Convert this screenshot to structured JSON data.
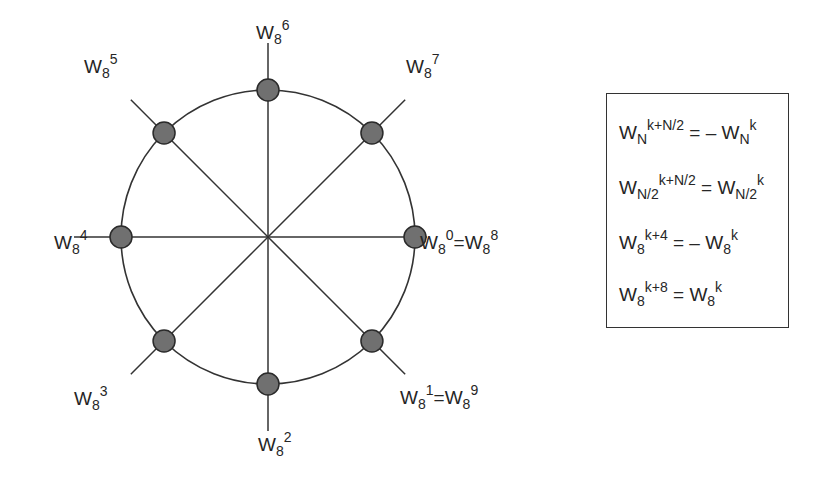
{
  "diagram": {
    "colors": {
      "node_fill": "#707070",
      "line": "#333333"
    },
    "nodes": [
      {
        "id": "w0",
        "label": [
          {
            "base": "W",
            "sub": "8",
            "sup": "0"
          },
          {
            "op": "="
          },
          {
            "base": "W",
            "sub": "8",
            "sup": "8"
          }
        ],
        "angle_deg": 0
      },
      {
        "id": "w1",
        "label": [
          {
            "base": "W",
            "sub": "8",
            "sup": "1"
          },
          {
            "op": "="
          },
          {
            "base": "W",
            "sub": "8",
            "sup": "9"
          }
        ],
        "angle_deg": -45
      },
      {
        "id": "w2",
        "label": [
          {
            "base": "W",
            "sub": "8",
            "sup": "2"
          }
        ],
        "angle_deg": -90
      },
      {
        "id": "w3",
        "label": [
          {
            "base": "W",
            "sub": "8",
            "sup": "3"
          }
        ],
        "angle_deg": -135
      },
      {
        "id": "w4",
        "label": [
          {
            "base": "W",
            "sub": "8",
            "sup": "4"
          }
        ],
        "angle_deg": 180
      },
      {
        "id": "w5",
        "label": [
          {
            "base": "W",
            "sub": "8",
            "sup": "5"
          }
        ],
        "angle_deg": 135
      },
      {
        "id": "w6",
        "label": [
          {
            "base": "W",
            "sub": "8",
            "sup": "6"
          }
        ],
        "angle_deg": 90
      },
      {
        "id": "w7",
        "label": [
          {
            "base": "W",
            "sub": "8",
            "sup": "7"
          }
        ],
        "angle_deg": 45
      }
    ]
  },
  "identities": [
    {
      "lhs": {
        "base": "W",
        "sub": "N",
        "sup": "k+N/2"
      },
      "op": "= –",
      "rhs": {
        "base": "W",
        "sub": "N",
        "sup": "k"
      }
    },
    {
      "lhs": {
        "base": "W",
        "sub": "N/2",
        "sup": "k+N/2"
      },
      "op": "=",
      "rhs": {
        "base": "W",
        "sub": "N/2",
        "sup": "k"
      }
    },
    {
      "lhs": {
        "base": "W",
        "sub": "8",
        "sup": "k+4"
      },
      "op": "= –",
      "rhs": {
        "base": "W",
        "sub": "8",
        "sup": "k"
      }
    },
    {
      "lhs": {
        "base": "W",
        "sub": "8",
        "sup": "k+8"
      },
      "op": "=",
      "rhs": {
        "base": "W",
        "sub": "8",
        "sup": "k"
      }
    }
  ]
}
